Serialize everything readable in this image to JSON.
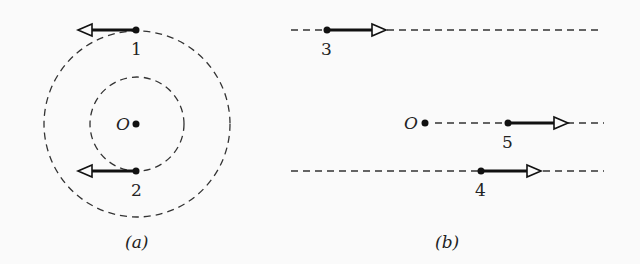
{
  "figure": {
    "panels": [
      {
        "id": "a",
        "caption": "(a)",
        "origin_label": "O",
        "circles": [
          {
            "name": "inner",
            "cx": 137,
            "cy": 124,
            "r": 47
          },
          {
            "name": "outer",
            "cx": 137,
            "cy": 124,
            "r": 93
          }
        ],
        "particles": [
          {
            "label": "1",
            "x": 136,
            "y": 30,
            "direction": "left"
          },
          {
            "label": "2",
            "x": 136,
            "y": 171,
            "direction": "left"
          }
        ]
      },
      {
        "id": "b",
        "caption": "(b)",
        "origin_label": "O",
        "lines": [
          {
            "name": "line-3",
            "y": 30
          },
          {
            "name": "line-5",
            "y": 123
          },
          {
            "name": "line-4",
            "y": 171
          }
        ],
        "particles": [
          {
            "label": "3",
            "x": 327,
            "y": 30,
            "direction": "right"
          },
          {
            "label": "5",
            "x": 508,
            "y": 123,
            "direction": "right"
          },
          {
            "label": "4",
            "x": 481,
            "y": 171,
            "direction": "right"
          }
        ]
      }
    ]
  }
}
